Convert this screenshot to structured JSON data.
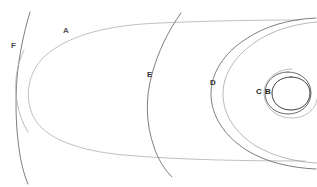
{
  "diagram": {
    "background_color": "#ffffff",
    "width": 317,
    "height": 187,
    "labels": [
      {
        "id": "label-a",
        "text": "A",
        "x": 63,
        "y": 27,
        "color": "#555555"
      },
      {
        "id": "label-f",
        "text": "F",
        "x": 11,
        "y": 42,
        "color": "#4a4a4a"
      },
      {
        "id": "label-e",
        "text": "E",
        "x": 147,
        "y": 71,
        "color": "#333333"
      },
      {
        "id": "label-d",
        "text": "D",
        "x": 210,
        "y": 79,
        "color": "#333333"
      },
      {
        "id": "label-c",
        "text": "C",
        "x": 256,
        "y": 88,
        "color": "#222222"
      },
      {
        "id": "label-b",
        "text": "B",
        "x": 265,
        "y": 88,
        "color": "#222222"
      }
    ],
    "curves": [
      {
        "id": "curve-a-outer-ellipse",
        "name": "outer-ellipse-a",
        "color": "#b9b9bd",
        "width": 0.9,
        "d": "M 300 20 C 250 20 205 21 160 23 C 110 25 70 34 45 56 C 28 72 24 96 33 116 C 44 139 80 151 124 155 C 180 160 250 161 305 161"
      },
      {
        "id": "curve-d-large-circle",
        "name": "large-circle-d",
        "color": "#6f6f72",
        "width": 0.9,
        "d": "M 316 18 C 290 19 265 26 246 39 C 224 53 211 73 211 94 C 211 116 225 137 248 151 C 266 162 291 168 316 169"
      },
      {
        "id": "curve-d-large-circle-echo",
        "name": "large-circle-d-echo",
        "color": "#9a9a9e",
        "width": 0.7,
        "d": "M 317 22 C 293 24 271 31 254 43 C 234 57 223 75 223 94 C 223 114 235 133 256 146 C 273 156 295 162 317 163"
      },
      {
        "id": "curve-e-arc",
        "name": "arc-e",
        "color": "#6f6f72",
        "width": 0.9,
        "d": "M 181 13 C 168 31 158 52 152 74 C 145 99 146 124 154 147 C 158 159 164 169 172 177"
      },
      {
        "id": "curve-f-arc",
        "name": "arc-f",
        "color": "#6f6f72",
        "width": 0.9,
        "d": "M 30 12 C 24 32 19 55 17 78 C 15 104 16 131 20 155 C 22 167 25 177 28 184"
      },
      {
        "id": "curve-f-inner-lobe",
        "name": "arc-f-inner-lobe",
        "color": "#a9a9ad",
        "width": 0.8,
        "d": "M 24 50 C 16 66 14 85 17 102 C 19 114 23 124 28 132"
      },
      {
        "id": "curve-c-outer-circle",
        "name": "circle-c",
        "color": "#5a5a5d",
        "width": 0.9,
        "d": "M 288 72 C 275 72 265 81 265 93 C 265 105 275 114 288 114 C 301 114 311 105 311 93 C 311 81 301 72 288 72 Z"
      },
      {
        "id": "curve-b-inner-circle",
        "name": "circle-b",
        "color": "#3e3e41",
        "width": 1.0,
        "d": "M 291 77 C 280 77 272 84 272 93 C 272 103 280 110 291 110 C 302 110 310 103 310 93 C 310 84 302 77 291 77 Z"
      },
      {
        "id": "curve-c-halo",
        "name": "circle-c-halo",
        "color": "#a0a0a4",
        "width": 0.7,
        "d": "M 292 69 C 276 69 264 80 264 93 C 264 107 276 118 292 118 C 305 118 316 110 317 99"
      }
    ]
  }
}
